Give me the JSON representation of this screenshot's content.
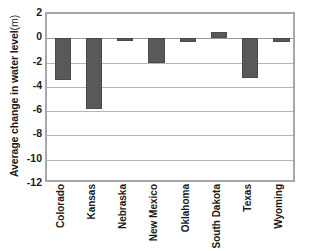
{
  "chart_data": {
    "type": "bar",
    "title": "",
    "xlabel": "",
    "ylabel": "Average change in water level",
    "ylabel_unit": "(m)",
    "ylim": [
      -12,
      2
    ],
    "yticks": [
      2,
      0,
      -2,
      -4,
      -6,
      -8,
      -10,
      -12
    ],
    "ytick_labels": [
      "2",
      "0",
      "-2",
      "-4",
      "-6",
      "-8",
      "-10",
      "-12"
    ],
    "grid": true,
    "grid_axis": "y",
    "legend": false,
    "categories": [
      "Colorado",
      "Kansas",
      "Nebraska",
      "New Mexico",
      "Oklahoma",
      "South Dakota",
      "Texas",
      "Wyoming"
    ],
    "values": [
      -3.4,
      -5.8,
      -0.2,
      -2.0,
      -0.3,
      0.5,
      -3.3,
      -0.3
    ],
    "bar_color": "#595959",
    "bar_edge_color": "#4a4a4a",
    "plot_border_color": "#a8a8a8",
    "gridline_color": "#b5b5b5",
    "background_color": "#ffffff"
  }
}
